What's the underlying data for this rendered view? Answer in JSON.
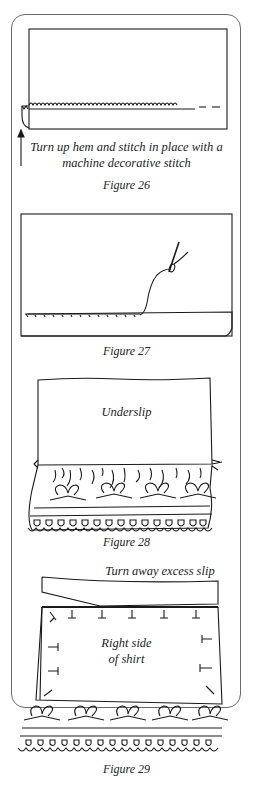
{
  "figures": [
    {
      "id": "figure-26",
      "caption": "Figure 26",
      "annotation_line1": "Turn up hem and stitch in place with a",
      "annotation_line2": "machine decorative stitch"
    },
    {
      "id": "figure-27",
      "caption": "Figure 27"
    },
    {
      "id": "figure-28",
      "caption": "Figure 28",
      "label": "Underslip"
    },
    {
      "id": "figure-29",
      "caption": "Figure 29",
      "annotation": "Turn away excess slip",
      "label_line1": "Right side",
      "label_line2": "of shirt"
    }
  ],
  "colors": {
    "line": "#1a1a1a",
    "frame": "#6b6b6b",
    "background": "#ffffff"
  }
}
